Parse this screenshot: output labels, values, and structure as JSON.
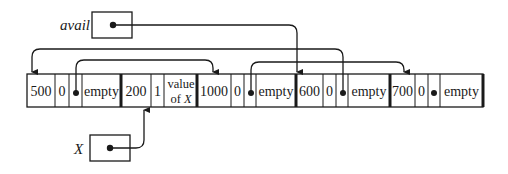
{
  "diagram": {
    "pointers": {
      "avail": {
        "label": "avail"
      },
      "x": {
        "label": "X"
      }
    },
    "blocks": [
      {
        "size": "500",
        "tag": "0",
        "has_link": true,
        "content": "empty"
      },
      {
        "size": "200",
        "tag": "1",
        "has_link": false,
        "content_line1": "value",
        "content_line2": "of X"
      },
      {
        "size": "1000",
        "tag": "0",
        "has_link": true,
        "content": "empty"
      },
      {
        "size": "600",
        "tag": "0",
        "has_link": true,
        "content": "empty"
      },
      {
        "size": "700",
        "tag": "0",
        "has_link": true,
        "content": "empty"
      }
    ],
    "links": [
      {
        "from": "avail",
        "to": "block-600"
      },
      {
        "from": "block-600-link",
        "to": "block-500"
      },
      {
        "from": "block-500-link",
        "to": "block-1000"
      },
      {
        "from": "block-1000-link",
        "to": "block-700"
      },
      {
        "from": "x",
        "to": "block-200"
      }
    ],
    "colors": {
      "ink": "#1a1a1a",
      "background": "#ffffff"
    }
  }
}
